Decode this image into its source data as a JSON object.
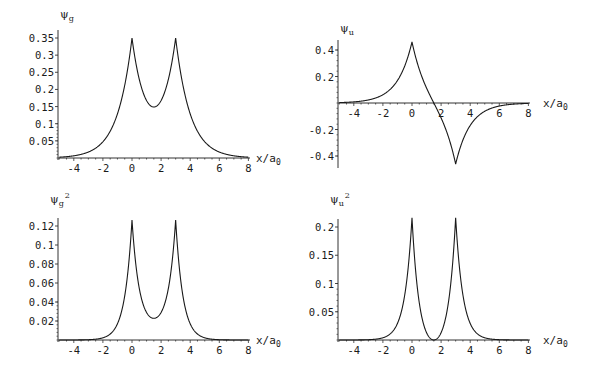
{
  "chart_data": [
    {
      "id": "psi_g",
      "type": "line",
      "title": "",
      "ylabel": "ψ_g",
      "xlabel": "x/a_0",
      "xlim": [
        -5,
        8
      ],
      "ylim": [
        0,
        0.36
      ],
      "grid": false,
      "x_ticks": [
        -4,
        -2,
        0,
        2,
        4,
        6,
        8
      ],
      "x_tick_labels": [
        "-4",
        "-2",
        "0",
        "2",
        "4",
        "6",
        "8"
      ],
      "y_ticks": [
        0.05,
        0.1,
        0.15,
        0.2,
        0.25,
        0.3,
        0.35
      ],
      "y_tick_labels": [
        "0.05",
        "0.1",
        "0.15",
        "0.2",
        "0.25",
        "0.3",
        "0.35"
      ],
      "series": [
        {
          "name": "ψ_g",
          "formula": "N*(exp(-|x|)+exp(-|x-3|))",
          "N": 0.3333,
          "sign": 1,
          "square": false,
          "x": [
            -5,
            -4,
            -3,
            -2,
            -1,
            0,
            0.5,
            1,
            1.5,
            2,
            2.5,
            3,
            4,
            5,
            6,
            7,
            8
          ],
          "values": [
            0.002,
            0.006,
            0.017,
            0.046,
            0.125,
            0.35,
            0.229,
            0.163,
            0.149,
            0.163,
            0.229,
            0.35,
            0.125,
            0.046,
            0.017,
            0.006,
            0.002
          ]
        }
      ],
      "annotations": [
        "peaks at x=0 and x=3 (≈0.35)",
        "minimum at x=1.5 (≈0.15)"
      ]
    },
    {
      "id": "psi_u",
      "type": "line",
      "title": "",
      "ylabel": "ψ_u",
      "xlabel": "x/a_0",
      "xlim": [
        -5,
        8
      ],
      "ylim": [
        -0.5,
        0.5
      ],
      "grid": false,
      "x_ticks": [
        -4,
        -2,
        0,
        2,
        4,
        6,
        8
      ],
      "x_tick_labels": [
        "-4",
        "-2",
        "0",
        "2",
        "4",
        "6",
        "8"
      ],
      "y_ticks": [
        -0.4,
        -0.2,
        0.2,
        0.4
      ],
      "y_tick_labels": [
        "-0.4",
        "-0.2",
        "0.2",
        "0.4"
      ],
      "series": [
        {
          "name": "ψ_u",
          "formula": "N*(exp(-|x|)-exp(-|x-3|))",
          "N": 0.485,
          "sign": -1,
          "square": false,
          "x": [
            -5,
            -4,
            -3,
            -2,
            -1,
            0,
            0.5,
            1,
            1.5,
            2,
            2.5,
            3,
            4,
            5,
            6,
            7,
            8
          ],
          "values": [
            0.003,
            0.009,
            0.024,
            0.064,
            0.172,
            0.461,
            0.254,
            0.113,
            0.0,
            -0.113,
            -0.254,
            -0.461,
            -0.172,
            -0.064,
            -0.024,
            -0.009,
            -0.003
          ]
        }
      ],
      "annotations": [
        "maximum at x=0 (≈0.46)",
        "minimum at x=3 (≈-0.46)",
        "node at x=1.5"
      ]
    },
    {
      "id": "psi_g_sq",
      "type": "line",
      "title": "",
      "ylabel": "ψ_g²",
      "xlabel": "x/a_0",
      "xlim": [
        -5,
        8
      ],
      "ylim": [
        0,
        0.13
      ],
      "grid": false,
      "x_ticks": [
        -4,
        -2,
        0,
        2,
        4,
        6,
        8
      ],
      "x_tick_labels": [
        "-4",
        "-2",
        "0",
        "2",
        "4",
        "6",
        "8"
      ],
      "y_ticks": [
        0.02,
        0.04,
        0.06,
        0.08,
        0.1,
        0.12
      ],
      "y_tick_labels": [
        "0.02",
        "0.04",
        "0.06",
        "0.08",
        "0.1",
        "0.12"
      ],
      "series": [
        {
          "name": "ψ_g²",
          "formula": "(N*(exp(-|x|)+exp(-|x-3|)))^2",
          "N": 0.3385,
          "sign": 1,
          "square": true,
          "x": [
            -5,
            -4,
            -3,
            -2,
            -1,
            0,
            0.5,
            1,
            1.5,
            2,
            2.5,
            3,
            4,
            5,
            6,
            7,
            8
          ],
          "values": [
            0.0,
            0.0,
            0.0003,
            0.0022,
            0.016,
            0.128,
            0.054,
            0.027,
            0.023,
            0.027,
            0.054,
            0.128,
            0.016,
            0.0022,
            0.0003,
            0.0,
            0.0
          ]
        }
      ],
      "annotations": [
        "peaks at x=0 and x=3 (≈0.128)",
        "minimum at x=1.5 (≈0.023)"
      ]
    },
    {
      "id": "psi_u_sq",
      "type": "line",
      "title": "",
      "ylabel": "ψ_u²",
      "xlabel": "x/a_0",
      "xlim": [
        -5,
        8
      ],
      "ylim": [
        0,
        0.22
      ],
      "grid": false,
      "x_ticks": [
        -4,
        -2,
        0,
        2,
        4,
        6,
        8
      ],
      "x_tick_labels": [
        "-4",
        "-2",
        "0",
        "2",
        "4",
        "6",
        "8"
      ],
      "y_ticks": [
        0.05,
        0.1,
        0.15,
        0.2
      ],
      "y_tick_labels": [
        "0.05",
        "0.1",
        "0.15",
        "0.2"
      ],
      "series": [
        {
          "name": "ψ_u²",
          "formula": "(N*(exp(-|x|)-exp(-|x-3|)))^2",
          "N": 0.4897,
          "sign": -1,
          "square": true,
          "x": [
            -5,
            -4,
            -3,
            -2,
            -1,
            0,
            0.5,
            1,
            1.5,
            2,
            2.5,
            3,
            4,
            5,
            6,
            7,
            8
          ],
          "values": [
            0.0,
            0.0001,
            0.0006,
            0.0041,
            0.03,
            0.216,
            0.066,
            0.013,
            0.0,
            0.013,
            0.066,
            0.216,
            0.03,
            0.0041,
            0.0006,
            0.0001,
            0.0
          ]
        }
      ],
      "annotations": [
        "peaks at x=0 and x=3 (≈0.216)",
        "zero at x=1.5"
      ]
    }
  ],
  "panels": [
    {
      "ylabel_main": "ψ",
      "ylabel_sub": "g",
      "ylabel_sup": "",
      "xlabel_main": "x/a",
      "xlabel_sub": "0"
    },
    {
      "ylabel_main": "ψ",
      "ylabel_sub": "u",
      "ylabel_sup": "",
      "xlabel_main": "x/a",
      "xlabel_sub": "0"
    },
    {
      "ylabel_main": "ψ",
      "ylabel_sub": "g",
      "ylabel_sup": "2",
      "xlabel_main": "x/a",
      "xlabel_sub": "0"
    },
    {
      "ylabel_main": "ψ",
      "ylabel_sub": "u",
      "ylabel_sup": "2",
      "xlabel_main": "x/a",
      "xlabel_sub": "0"
    }
  ],
  "style": {
    "line_color": "#1a1a1a",
    "axis_color": "#333333",
    "background": "#ffffff"
  }
}
